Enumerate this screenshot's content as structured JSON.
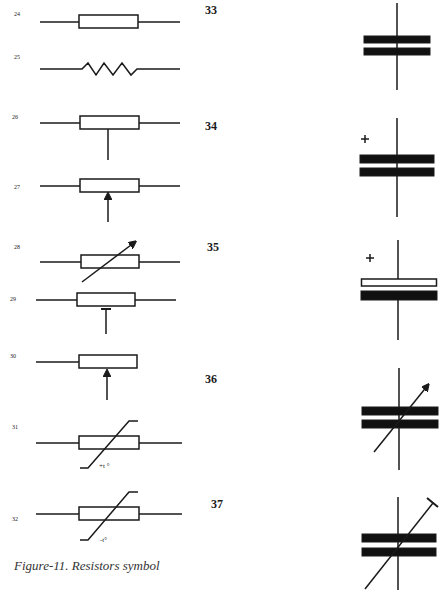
{
  "figure": {
    "caption": "Figure-11. Resistors symbol",
    "resistor_symbols": [
      {
        "id": "24",
        "label": "24",
        "type": "fixed-resistor-box"
      },
      {
        "id": "25",
        "label": "25",
        "type": "fixed-resistor-zigzag"
      },
      {
        "id": "26",
        "label": "26",
        "type": "tapped-resistor"
      },
      {
        "id": "27",
        "label": "27",
        "type": "potentiometer-arrow"
      },
      {
        "id": "28",
        "label": "28",
        "type": "variable-resistor"
      },
      {
        "id": "29",
        "label": "29",
        "type": "preset-resistor"
      },
      {
        "id": "30",
        "label": "30",
        "type": "potentiometer-wiper"
      },
      {
        "id": "31",
        "label": "31",
        "type": "thermistor-ptc",
        "annotation": "+t °"
      },
      {
        "id": "32",
        "label": "32",
        "type": "thermistor-ntc",
        "annotation": "-t°"
      }
    ],
    "capacitor_symbols": [
      {
        "id": "33",
        "label": "33",
        "type": "fixed-capacitor"
      },
      {
        "id": "34",
        "label": "34",
        "type": "polarized-capacitor",
        "polarity": "+"
      },
      {
        "id": "35",
        "label": "35",
        "type": "electrolytic-capacitor",
        "polarity": "+"
      },
      {
        "id": "36",
        "label": "36",
        "type": "variable-capacitor"
      },
      {
        "id": "37",
        "label": "37",
        "type": "trimmer-capacitor"
      }
    ]
  }
}
